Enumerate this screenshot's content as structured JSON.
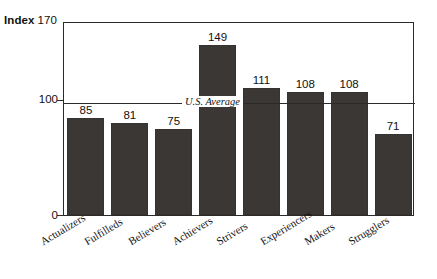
{
  "chart_data": {
    "type": "bar",
    "title": "",
    "xlabel": "",
    "ylabel": "Index",
    "ylim": [
      0,
      170
    ],
    "yticks": [
      0,
      100,
      170
    ],
    "grid": false,
    "legend": false,
    "categories": [
      "Actualizers",
      "Fulfilleds",
      "Believers",
      "Achievers",
      "Strivers",
      "Experiencers",
      "Makers",
      "Strugglers"
    ],
    "values": [
      85,
      81,
      75,
      149,
      111,
      108,
      108,
      71
    ],
    "annotations": [
      {
        "name": "reference-line",
        "label": "U.S. Average",
        "value": 100,
        "orientation": "horizontal"
      }
    ],
    "bar_color": "#3b3734",
    "axis_color": "#2a2a2a",
    "background": "#ffffff"
  },
  "axis": {
    "index_word": "Index",
    "index_max": "170",
    "tick_100": "100",
    "tick_0": "0"
  },
  "reference": {
    "label": "U.S. Average"
  }
}
